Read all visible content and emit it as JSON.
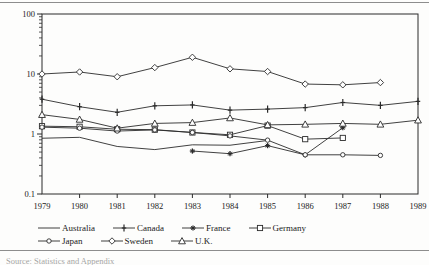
{
  "source_note": "Source: Statistics and Appendix",
  "chart_data": {
    "type": "line",
    "title": "",
    "xlabel": "",
    "ylabel": "",
    "yscale": "log",
    "ylim": [
      0.1,
      100
    ],
    "ytick_labels": [
      "100",
      "10",
      "1",
      "0.1"
    ],
    "ytick_values": [
      100,
      10,
      1,
      0.1
    ],
    "grid": false,
    "legend_position": "bottom",
    "x": [
      1979,
      1980,
      1981,
      1982,
      1983,
      1984,
      1985,
      1986,
      1987,
      1988,
      1989
    ],
    "xtick_labels": [
      "1979",
      "1980",
      "1981",
      "1982",
      "1983",
      "1984",
      "1985",
      "1986",
      "1987",
      "1988",
      "1989"
    ],
    "series": [
      {
        "name": "Australia",
        "marker": "none",
        "x": [
          1979,
          1980,
          1981,
          1982,
          1983,
          1984,
          1985
        ],
        "values": [
          0.85,
          0.88,
          0.62,
          0.55,
          0.66,
          0.65,
          0.78
        ]
      },
      {
        "name": "Canada",
        "marker": "plus",
        "x": [
          1979,
          1980,
          1981,
          1982,
          1983,
          1984,
          1985,
          1986,
          1987,
          1988,
          1989
        ],
        "values": [
          3.8,
          2.85,
          2.3,
          2.95,
          3.05,
          2.5,
          2.6,
          2.75,
          3.35,
          3.0,
          3.5
        ]
      },
      {
        "name": "France",
        "marker": "asterisk",
        "x": [
          1983,
          1984,
          1985,
          1986,
          1987
        ],
        "values": [
          0.52,
          0.47,
          0.64,
          0.45,
          1.27
        ]
      },
      {
        "name": "Germany",
        "marker": "open-square",
        "x": [
          1979,
          1980,
          1981,
          1982,
          1983,
          1984,
          1985,
          1986,
          1987
        ],
        "values": [
          1.35,
          1.32,
          1.2,
          1.18,
          1.06,
          0.97,
          1.38,
          0.82,
          0.86
        ]
      },
      {
        "name": "Japan",
        "marker": "open-circle-small",
        "x": [
          1979,
          1980,
          1981,
          1982,
          1983,
          1984,
          1985,
          1986,
          1987,
          1988
        ],
        "values": [
          1.3,
          1.25,
          1.12,
          1.17,
          1.06,
          0.93,
          0.79,
          0.45,
          0.45,
          0.44
        ]
      },
      {
        "name": "Sweden",
        "marker": "open-diamond",
        "x": [
          1979,
          1980,
          1981,
          1982,
          1983,
          1984,
          1985,
          1986,
          1987,
          1988
        ],
        "values": [
          10.0,
          10.8,
          9.0,
          12.8,
          19.0,
          12.2,
          11.0,
          6.8,
          6.6,
          7.2
        ]
      },
      {
        "name": "U.K.",
        "marker": "open-triangle",
        "x": [
          1979,
          1980,
          1981,
          1982,
          1983,
          1984,
          1985,
          1986,
          1987,
          1988,
          1989
        ],
        "values": [
          2.1,
          1.75,
          1.25,
          1.5,
          1.55,
          1.85,
          1.42,
          1.45,
          1.5,
          1.45,
          1.7
        ]
      }
    ],
    "legend_rows": [
      [
        "Australia",
        "Canada",
        "France",
        "Germany"
      ],
      [
        "Japan",
        "Sweden",
        "U.K."
      ]
    ]
  }
}
